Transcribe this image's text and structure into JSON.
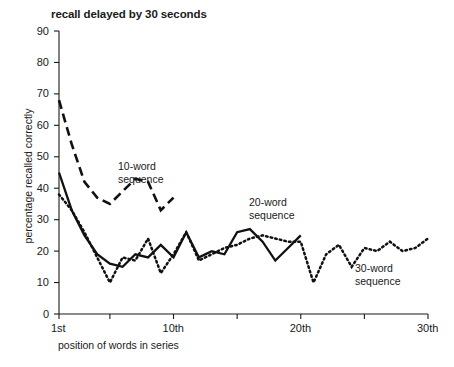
{
  "chart_data": {
    "type": "line",
    "title": "recall delayed by 30 seconds",
    "xlabel": "position of words in series",
    "ylabel": "percentage recalled correctly",
    "ylim": [
      0,
      90
    ],
    "xlim": [
      1,
      30
    ],
    "yticks": [
      0,
      10,
      20,
      30,
      40,
      50,
      60,
      70,
      80,
      90
    ],
    "ytick_labels": [
      "0",
      "10",
      "20",
      "30",
      "40",
      "50",
      "60",
      "70",
      "80",
      "90"
    ],
    "xticks": [
      1,
      5,
      10,
      15,
      20,
      25,
      30
    ],
    "xtick_labels": [
      "1st",
      "",
      "10th",
      "",
      "20th",
      "",
      "30th"
    ],
    "xtick_labels_shown": [
      "1st",
      "10th",
      "20th",
      "30th"
    ],
    "grid": false,
    "legend_position": "inline-annotations",
    "series": [
      {
        "name": "10-word sequence",
        "style": "dashed",
        "color": "#111111",
        "x": [
          1,
          2,
          3,
          4,
          5,
          6,
          7,
          8,
          9,
          10
        ],
        "values": [
          68,
          54,
          42,
          37,
          35,
          39,
          43,
          42,
          33,
          37
        ]
      },
      {
        "name": "20-word sequence",
        "style": "solid",
        "color": "#111111",
        "x": [
          1,
          2,
          3,
          4,
          5,
          6,
          7,
          8,
          9,
          10,
          11,
          12,
          13,
          14,
          15,
          16,
          17,
          18,
          19,
          20
        ],
        "values": [
          45,
          33,
          25,
          19,
          16,
          15,
          19,
          18,
          22,
          18,
          26,
          18,
          20,
          19,
          26,
          27,
          23,
          17,
          21,
          25
        ]
      },
      {
        "name": "30-word sequence",
        "style": "dotted",
        "color": "#111111",
        "x": [
          1,
          2,
          3,
          4,
          5,
          6,
          7,
          8,
          9,
          10,
          11,
          12,
          13,
          14,
          15,
          16,
          17,
          18,
          19,
          20,
          21,
          22,
          23,
          24,
          25,
          26,
          27,
          28,
          29,
          30
        ],
        "values": [
          38,
          33,
          26,
          18,
          10,
          18,
          17,
          24,
          13,
          19,
          26,
          17,
          19,
          21,
          22,
          24,
          25,
          24,
          23,
          23,
          10,
          19,
          22,
          15,
          21,
          20,
          23,
          20,
          21,
          24
        ]
      }
    ],
    "annotations": [
      {
        "text_line1": "10-word",
        "text_line2": "sequence",
        "x_px": 118,
        "y_px": 160
      },
      {
        "text_line1": "20-word",
        "text_line2": "sequence",
        "x_px": 249,
        "y_px": 196
      },
      {
        "text_line1": "30-word",
        "text_line2": "sequence",
        "x_px": 355,
        "y_px": 262
      }
    ]
  }
}
